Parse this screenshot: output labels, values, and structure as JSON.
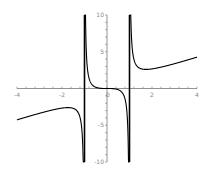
{
  "chart_data": {
    "type": "line",
    "title": "",
    "xlabel": "",
    "ylabel": "",
    "xlim": [
      -4,
      4
    ],
    "ylim": [
      -10,
      10
    ],
    "grid": false,
    "legend": null,
    "x_ticks": [
      -4,
      -2,
      0,
      2,
      4
    ],
    "x_tick_labels": [
      "-4",
      "-2",
      "0",
      "2",
      "4"
    ],
    "y_ticks": [
      -10,
      -5,
      5,
      10
    ],
    "y_tick_labels": [
      "-10",
      "-5",
      "5",
      "10"
    ],
    "vertical_asymptotes": [
      -1,
      1
    ],
    "series": [
      {
        "name": "f(x) = x^3/(x^2-1)",
        "x": [
          -4,
          -3.5,
          -3,
          -2.5,
          -2,
          -1.73,
          -1.5,
          -1.3,
          -1.2,
          -1.1,
          -1.05,
          -0.95,
          -0.9,
          -0.8,
          -0.6,
          -0.4,
          -0.2,
          0,
          0.2,
          0.4,
          0.6,
          0.8,
          0.9,
          0.95,
          1.05,
          1.1,
          1.2,
          1.3,
          1.5,
          1.73,
          2,
          2.5,
          3,
          3.5,
          4
        ],
        "values": [
          -4.27,
          -3.81,
          -3.38,
          -2.98,
          -2.67,
          -2.6,
          -2.7,
          -3.17,
          -3.93,
          -6.34,
          -11.3,
          8.35,
          3.84,
          1.42,
          0.34,
          0.08,
          0.01,
          0,
          -0.01,
          -0.08,
          -0.34,
          -1.42,
          -3.84,
          -8.35,
          11.3,
          6.34,
          3.93,
          3.17,
          2.7,
          2.6,
          2.67,
          2.98,
          3.38,
          3.81,
          4.27
        ]
      }
    ],
    "color": "#000000"
  },
  "axes": {
    "x_labels": [
      "-4",
      "-2",
      "0",
      "2",
      "4"
    ],
    "y_labels": [
      "10",
      "5",
      "-5",
      "-10"
    ]
  }
}
